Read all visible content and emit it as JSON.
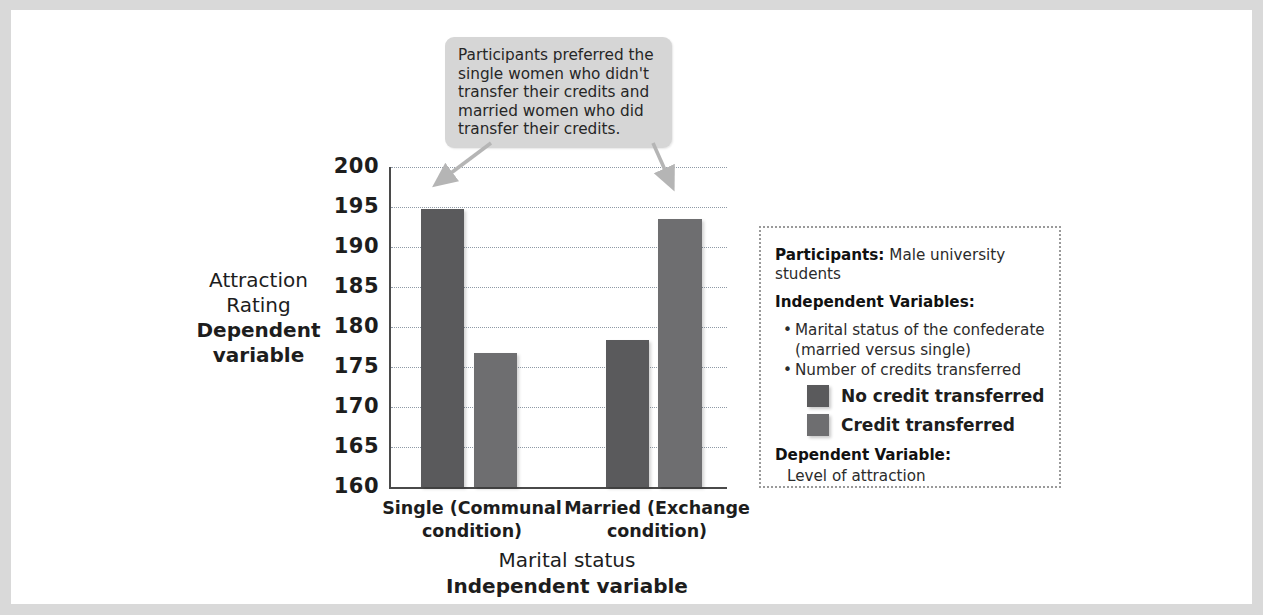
{
  "chart_data": {
    "type": "bar",
    "title": "",
    "categories": [
      "Single (Communal condition)",
      "Married (Exchange condition)"
    ],
    "category_lines": [
      [
        "Single (Communal",
        "condition)"
      ],
      [
        "Married (Exchange",
        "condition)"
      ]
    ],
    "series": [
      {
        "name": "No credit transferred",
        "values": [
          194.7,
          178.4
        ],
        "color": "#5a5a5c"
      },
      {
        "name": "Credit transferred",
        "values": [
          176.8,
          193.5
        ],
        "color": "#6e6e70"
      }
    ],
    "xlabel": "Marital status",
    "xlabel_sub": "Independent variable",
    "ylabel": "Attraction Rating",
    "ylabel_sub": "Dependent variable",
    "ylim": [
      160,
      200
    ],
    "ytick_step": 5,
    "yticks": [
      "200",
      "195",
      "190",
      "185",
      "180",
      "175",
      "170",
      "165",
      "160"
    ],
    "grid": true,
    "legend_position": "right-panel"
  },
  "callout": {
    "text": "Participants preferred the single women who didn't transfer their credits and married women who did transfer their credits.",
    "background": "#d6d6d6",
    "arrow_color": "#b5b5b5"
  },
  "info_panel": {
    "participants_label": "Participants:",
    "participants_value": "Male university students",
    "iv_label": "Independent Variables:",
    "iv_bullets": [
      "Marital status of the confederate (married versus single)",
      "Number of credits transferred"
    ],
    "iv_bullet_lines": [
      [
        "Marital status of the confederate",
        "(married versus single)"
      ],
      [
        "Number of credits transferred"
      ]
    ],
    "legend": [
      {
        "label": "No credit transferred",
        "color": "#5a5a5c"
      },
      {
        "label": "Credit transferred",
        "color": "#6e6e70"
      }
    ],
    "dv_label": "Dependent Variable:",
    "dv_value": "Level of attraction"
  },
  "colors": {
    "page_background": "#d9d9d9",
    "canvas": "#ffffff",
    "axis": "#4a4a4a",
    "gridline": "#8f9aa6",
    "panel_border": "#9a9a9a",
    "text": "#1d1d1d"
  }
}
